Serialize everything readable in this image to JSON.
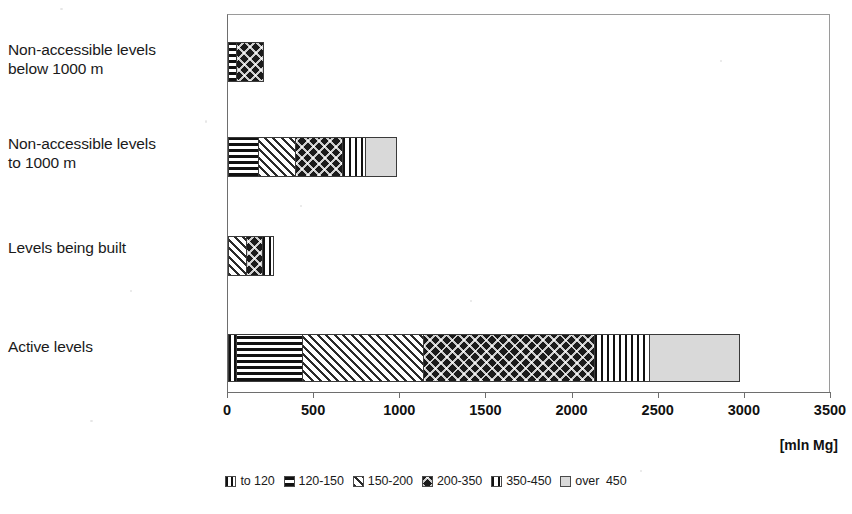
{
  "chart_data": {
    "type": "bar",
    "orientation": "horizontal",
    "stacked": true,
    "title": "",
    "subtitle": "",
    "xlabel": "[mln Mg]",
    "ylabel": "",
    "xlim": [
      0,
      3500
    ],
    "xticks": [
      0,
      500,
      1000,
      1500,
      2000,
      2500,
      3000,
      3500
    ],
    "xtick_labels": [
      "0",
      "500",
      "1000",
      "1500",
      "2000",
      "2500",
      "3000",
      "3500"
    ],
    "grid": false,
    "legend_position": "bottom",
    "categories": [
      "Non-accessible levels below 1000 m",
      "Non-accessible levels to 1000 m",
      "Levels being built",
      "Active levels"
    ],
    "series": [
      {
        "name": "to 120",
        "values": [
          0,
          0,
          0,
          50
        ]
      },
      {
        "name": "120-150",
        "values": [
          50,
          180,
          0,
          390
        ]
      },
      {
        "name": "150-200",
        "values": [
          0,
          220,
          110,
          710
        ]
      },
      {
        "name": "200-350",
        "values": [
          165,
          280,
          100,
          1000
        ]
      },
      {
        "name": "350-450",
        "values": [
          0,
          140,
          70,
          320
        ]
      },
      {
        "name": "over  450",
        "values": [
          0,
          185,
          0,
          530
        ]
      }
    ],
    "totals": [
      215,
      1005,
      280,
      3000
    ]
  },
  "axis": {
    "unit_label": "[mln Mg]",
    "ticks": [
      {
        "label": "0"
      },
      {
        "label": "500"
      },
      {
        "label": "1000"
      },
      {
        "label": "1500"
      },
      {
        "label": "2000"
      },
      {
        "label": "2500"
      },
      {
        "label": "3000"
      },
      {
        "label": "3500"
      }
    ]
  },
  "categories": [
    {
      "line1": "Non-accessible levels",
      "line2": "below 1000 m"
    },
    {
      "line1": "Non-accessible levels",
      "line2": "to 1000 m"
    },
    {
      "line1": "Levels being built",
      "line2": ""
    },
    {
      "line1": "Active levels",
      "line2": ""
    }
  ],
  "legend": {
    "items": [
      {
        "label": "to 120",
        "pattern": "vertical-lines",
        "color": "#111111"
      },
      {
        "label": "120-150",
        "pattern": "horizontal-lines",
        "color": "#111111"
      },
      {
        "label": "150-200",
        "pattern": "diagonal-hatch",
        "color": "#2a2a2a"
      },
      {
        "label": "200-350",
        "pattern": "dark-crosshatch",
        "color": "#1b1b1b"
      },
      {
        "label": "350-450",
        "pattern": "grid-mesh",
        "color": "#111111"
      },
      {
        "label": "over  450",
        "pattern": "solid-light-gray",
        "color": "#d9d9d9"
      }
    ]
  },
  "colors": {
    "background": "#ffffff",
    "axis": "#6e6e6e",
    "frame": "#9a9a9a",
    "text": "#1a1a1a",
    "light_fill": "#d9d9d9",
    "dark_fill": "#1b1b1b"
  }
}
